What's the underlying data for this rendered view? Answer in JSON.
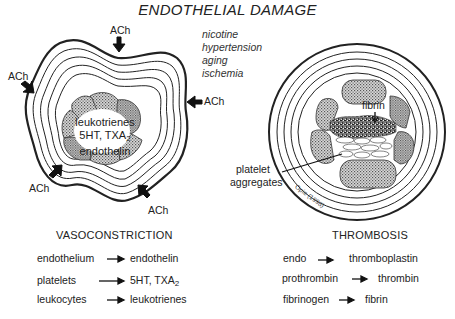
{
  "title": "ENDOTHELIAL DAMAGE",
  "causes": [
    "nicotine",
    "hypertension",
    "aging",
    "ischemia"
  ],
  "left_diagram": {
    "stimulus_label": "ACh",
    "arrows": [
      {
        "position": "top",
        "label": "ACh"
      },
      {
        "position": "upper-left",
        "label": "ACh"
      },
      {
        "position": "right",
        "label": "ACh"
      },
      {
        "position": "lower-left",
        "label": "ACh"
      },
      {
        "position": "lower-right",
        "label": "ACh"
      }
    ],
    "lumen_labels": [
      "leukotrienes",
      "5HT, TXA",
      "2",
      "endothelin"
    ]
  },
  "right_diagram": {
    "fibrin_label": "fibrin",
    "platelet_label_line1": "platelet",
    "platelet_label_line2": "aggregates",
    "citation": "Opie (1998)"
  },
  "vasoconstriction": {
    "heading": "VASOCONSTRICTION",
    "rows": [
      {
        "from": "endothelium",
        "to": "endothelin",
        "sub": ""
      },
      {
        "from": "platelets",
        "to": "5HT, TXA",
        "sub": "2"
      },
      {
        "from": "leukocytes",
        "to": "leukotrienes",
        "sub": ""
      }
    ]
  },
  "thrombosis": {
    "heading": "THROMBOSIS",
    "rows": [
      {
        "from": "endo",
        "to": "thromboplastin"
      },
      {
        "from": "prothrombin",
        "to": "thrombin"
      },
      {
        "from": "fibrinogen",
        "to": "fibrin"
      }
    ]
  },
  "colors": {
    "ink": "#222222",
    "stipple": "#9a9a9a",
    "background": "#ffffff"
  }
}
